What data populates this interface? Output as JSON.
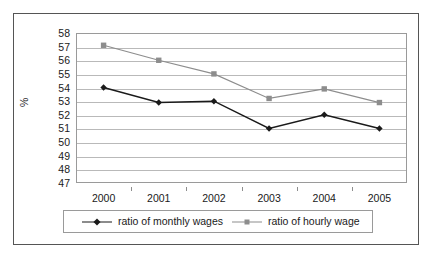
{
  "chart_data": {
    "type": "line",
    "title": "",
    "xlabel": "",
    "ylabel": "%",
    "categories": [
      "2000",
      "2001",
      "2002",
      "2003",
      "2004",
      "2005"
    ],
    "ylim": [
      47,
      58
    ],
    "y_ticks": [
      58,
      57,
      56,
      55,
      54,
      53,
      52,
      51,
      50,
      49,
      48,
      47
    ],
    "grid": true,
    "legend_position": "bottom",
    "series": [
      {
        "name": "ratio of monthly wages",
        "color": "#1a1a1a",
        "marker": "diamond",
        "values": [
          54.0,
          52.9,
          53.0,
          51.0,
          52.0,
          51.0
        ]
      },
      {
        "name": "ratio of hourly wage",
        "color": "#8d8d8d",
        "marker": "square",
        "values": [
          57.1,
          56.0,
          55.0,
          53.2,
          53.9,
          52.9
        ]
      }
    ]
  },
  "legend": {
    "entries": [
      {
        "label": "ratio of monthly wages"
      },
      {
        "label": "ratio of hourly wage"
      }
    ]
  }
}
